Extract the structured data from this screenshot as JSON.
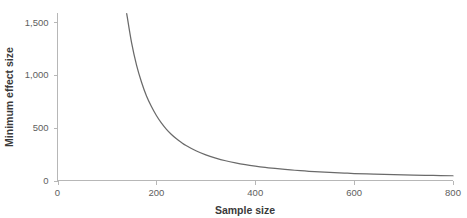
{
  "chart_data": {
    "type": "line",
    "title": "",
    "xlabel": "Sample size",
    "ylabel": "Minimum effect size",
    "xlim": [
      0,
      800
    ],
    "ylim": [
      0,
      1620
    ],
    "grid": false,
    "legend": false,
    "xticks": [
      0,
      200,
      400,
      600,
      800
    ],
    "xticklabels": [
      "0",
      "200",
      "400",
      "600",
      "800"
    ],
    "yticks": [
      0,
      500,
      1000,
      1500
    ],
    "yticklabels": [
      "0",
      "500",
      "1,000",
      "1,500"
    ],
    "series": [
      {
        "name": "Minimum effect size",
        "color": "#6a6a6a",
        "x": [
          140,
          150,
          160,
          170,
          180,
          190,
          200,
          210,
          220,
          230,
          240,
          250,
          260,
          280,
          300,
          320,
          340,
          360,
          380,
          400,
          420,
          440,
          460,
          480,
          500,
          520,
          540,
          560,
          580,
          600,
          640,
          680,
          720,
          760,
          800
        ],
        "y": [
          1580,
          1300,
          1090,
          930,
          800,
          700,
          615,
          545,
          487,
          438,
          397,
          362,
          331,
          281,
          242,
          212,
          187,
          167,
          150,
          136,
          124,
          114,
          105,
          97,
          90,
          84,
          79,
          74,
          70,
          66,
          60,
          55,
          51,
          48,
          45
        ]
      }
    ]
  },
  "axes": {
    "x_title": "Sample size",
    "y_title": "Minimum effect size"
  },
  "colors": {
    "curve": "#6a6a6a",
    "axis": "#b7b7b7",
    "tick_text": "#5e5e5e",
    "title_text": "#3a3a3a",
    "background": "#ffffff"
  }
}
